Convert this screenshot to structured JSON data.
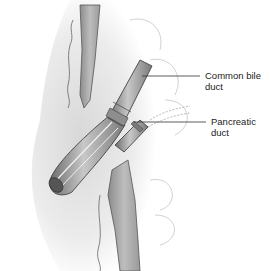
{
  "diagram": {
    "type": "anatomical-illustration",
    "labels": [
      {
        "id": "common-bile-duct",
        "line1": "Common bile",
        "line2": "duct"
      },
      {
        "id": "pancreatic-duct",
        "line1": "Pancreatic",
        "line2": "duct"
      }
    ],
    "colors": {
      "background": "#ffffff",
      "tissue_shading": "#d9d9d9",
      "duct_fill": "#9a9a9a",
      "duct_dark": "#5a5a5a",
      "outline": "#555555",
      "leader_line": "#333333"
    }
  }
}
